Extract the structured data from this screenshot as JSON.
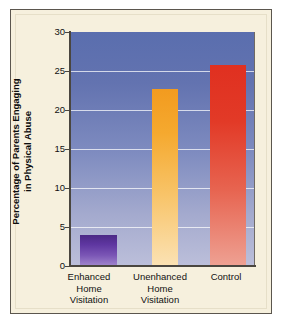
{
  "chart_data": {
    "type": "bar",
    "title": "",
    "subtitle": "",
    "xlabel": "",
    "ylabel_line1": "Percentage of Parents Engaging",
    "ylabel_line2": "in Physical Abuse",
    "ylabel": "Percentage of Parents Engaging in Physical Abuse",
    "categories": [
      "Enhanced Home Visitation",
      "Unenhanced Home Visitation",
      "Control"
    ],
    "category_lines": [
      [
        "Enhanced",
        "Home",
        "Visitation"
      ],
      [
        "Unenhanced",
        "Home",
        "Visitation"
      ],
      [
        "Control"
      ]
    ],
    "values": [
      4,
      22.7,
      25.8
    ],
    "ylim": [
      0,
      30
    ],
    "ytick_values": [
      0,
      5,
      10,
      15,
      20,
      25,
      30
    ],
    "ytick_labels": [
      "0",
      "5",
      "10",
      "15",
      "20",
      "25",
      "30"
    ],
    "grid": "horizontal",
    "legend": "none",
    "bar_colors": [
      "#5e36a0",
      "#f5a92f",
      "#e23a27"
    ],
    "plot_background_top": "#5a6eae",
    "plot_background_bottom": "#bcbfda",
    "panel_color": "#f6f0dd",
    "axis_color": "#4a463f",
    "gridline_color": "#ffffff"
  }
}
